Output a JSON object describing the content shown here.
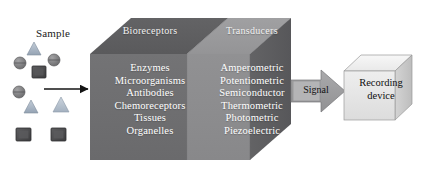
{
  "figure": {
    "type": "block-diagram"
  },
  "sample": {
    "label": "Sample",
    "particles": [
      {
        "shape": "triangle",
        "fill": "#9aa8b8",
        "x": 34,
        "y": 48,
        "size": 13
      },
      {
        "shape": "circle",
        "fill": "#7e7e80",
        "x": 15,
        "y": 63,
        "size": 12
      },
      {
        "shape": "circle",
        "fill": "#8c8c8e",
        "x": 49,
        "y": 60,
        "size": 12
      },
      {
        "shape": "square",
        "fill": "#4d4d4f",
        "x": 31,
        "y": 75,
        "size": 13
      },
      {
        "shape": "circle",
        "fill": "#7b7b7d",
        "x": 14,
        "y": 95,
        "size": 12
      },
      {
        "shape": "triangle",
        "fill": "#9aa8b8",
        "x": 27,
        "y": 110,
        "size": 13
      },
      {
        "shape": "triangle",
        "fill": "#b3bfcc",
        "x": 56,
        "y": 101,
        "size": 14
      },
      {
        "shape": "square",
        "fill": "#565658",
        "x": 14,
        "y": 132,
        "size": 13
      },
      {
        "shape": "square",
        "fill": "#4f4f51",
        "x": 48,
        "y": 132,
        "size": 13
      }
    ],
    "inlet_arrow": "right-arrow"
  },
  "box": {
    "bioreceptors": {
      "title": "Bioreceptors",
      "items": [
        "Enzymes",
        "Microorganisms",
        "Antibodies",
        "Chemoreceptors",
        "Tissues",
        "Organelles"
      ],
      "front_color": "#6e6e70",
      "top_color": "#5f5f61",
      "text_color": "#ffffff"
    },
    "transducers": {
      "title": "Transducers",
      "items": [
        "Amperometric",
        "Potentiometric",
        "Semiconductor",
        "Thermometric",
        "Photometric",
        "Piezoelectric"
      ],
      "front_color": "#8d8d8f",
      "top_color": "#9a9a9c",
      "text_color": "#ffffff"
    },
    "side_color": "#5c5c5e"
  },
  "signal": {
    "label": "Signal",
    "arrow_fill": "#9d9d9f",
    "arrow_stroke": "#6f6f71"
  },
  "recording_device": {
    "label_line1": "Recording",
    "label_line2": "device",
    "front_color": "#e4e4e4",
    "top_color": "#f2f2f2",
    "side_color": "#c9c9c9",
    "stroke": "#8e8e8e"
  },
  "colors": {
    "background": "#ffffff",
    "arrow_black": "#141414"
  }
}
